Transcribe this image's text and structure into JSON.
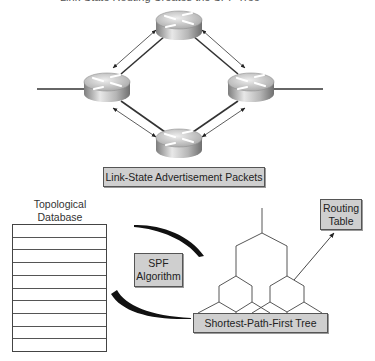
{
  "caption": "Link-State Routing Creates the SPF Tree",
  "network": {
    "routers": [
      {
        "id": "top",
        "cx": 179,
        "cy": 25
      },
      {
        "id": "left",
        "cx": 107,
        "cy": 87
      },
      {
        "id": "right",
        "cx": 251,
        "cy": 87
      },
      {
        "id": "bottom",
        "cx": 179,
        "cy": 142
      }
    ],
    "lsa_label": "Link-State Advertisement Packets"
  },
  "database": {
    "title_line1": "Topological",
    "title_line2": "Database",
    "row_count": 10
  },
  "algorithm": {
    "line1": "SPF",
    "line2": "Algorithm"
  },
  "tree": {
    "label": "Shortest-Path-First Tree"
  },
  "routing_table": {
    "line1": "Routing",
    "line2": "Table"
  },
  "colors": {
    "box_fill": "#cfcfcf",
    "line": "#333333",
    "router_light": "#e6e6e6",
    "router_dark": "#8a8a8a"
  }
}
